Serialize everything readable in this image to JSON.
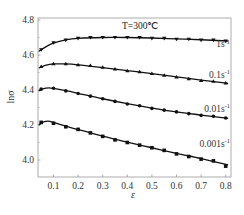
{
  "chart_data": {
    "type": "line",
    "title": "",
    "annotation": "T=300℃",
    "xlabel": "ε",
    "ylabel": "lnσ",
    "xlim": [
      0.04,
      0.81
    ],
    "ylim": [
      3.9,
      4.8
    ],
    "xticks": [
      0.1,
      0.2,
      0.3,
      0.4,
      0.5,
      0.6,
      0.7,
      0.8
    ],
    "xtick_labels": [
      "0.1",
      "0.2",
      "0.3",
      "0.4",
      "0.5",
      "0.6",
      "0.7",
      "0.8"
    ],
    "yticks": [
      4.0,
      4.2,
      4.4,
      4.6,
      4.8
    ],
    "ytick_labels": [
      "4.0",
      "4.2",
      "4.4",
      "4.6",
      "4.8"
    ],
    "grid": false,
    "legend": "inline labels at right end of each curve",
    "series": [
      {
        "name": "1s⁻¹",
        "label": "1s",
        "marker": "triangle-down",
        "x": [
          0.05,
          0.1,
          0.15,
          0.2,
          0.25,
          0.3,
          0.35,
          0.4,
          0.45,
          0.5,
          0.55,
          0.6,
          0.65,
          0.7,
          0.75,
          0.8
        ],
        "y": [
          4.63,
          4.67,
          4.685,
          4.695,
          4.7,
          4.7,
          4.7,
          4.7,
          4.7,
          4.695,
          4.695,
          4.69,
          4.69,
          4.685,
          4.685,
          4.68
        ]
      },
      {
        "name": "0.1s⁻¹",
        "label": "0.1s",
        "marker": "triangle-up",
        "x": [
          0.05,
          0.1,
          0.15,
          0.2,
          0.25,
          0.3,
          0.35,
          0.4,
          0.45,
          0.5,
          0.55,
          0.6,
          0.65,
          0.7,
          0.75,
          0.8
        ],
        "y": [
          4.535,
          4.55,
          4.55,
          4.545,
          4.54,
          4.53,
          4.52,
          4.51,
          4.505,
          4.495,
          4.485,
          4.475,
          4.465,
          4.455,
          4.45,
          4.44
        ]
      },
      {
        "name": "0.01s⁻¹",
        "label": "0.01s",
        "marker": "circle",
        "x": [
          0.05,
          0.1,
          0.15,
          0.2,
          0.25,
          0.3,
          0.35,
          0.4,
          0.45,
          0.5,
          0.55,
          0.6,
          0.65,
          0.7,
          0.75,
          0.8
        ],
        "y": [
          4.405,
          4.41,
          4.395,
          4.38,
          4.365,
          4.35,
          4.335,
          4.32,
          4.31,
          4.295,
          4.285,
          4.275,
          4.265,
          4.255,
          4.25,
          4.24
        ]
      },
      {
        "name": "0.001s⁻¹",
        "label": "0.001s",
        "marker": "square",
        "x": [
          0.05,
          0.1,
          0.15,
          0.2,
          0.25,
          0.3,
          0.35,
          0.4,
          0.45,
          0.5,
          0.55,
          0.6,
          0.65,
          0.7,
          0.75,
          0.8
        ],
        "y": [
          4.215,
          4.21,
          4.19,
          4.175,
          4.155,
          4.135,
          4.115,
          4.1,
          4.085,
          4.07,
          4.055,
          4.035,
          4.02,
          4.005,
          3.995,
          3.965
        ]
      }
    ],
    "fit_curves": [
      [
        [
          0.04,
          4.62
        ],
        [
          0.07,
          4.648
        ],
        [
          0.1,
          4.668
        ],
        [
          0.15,
          4.686
        ],
        [
          0.2,
          4.695
        ],
        [
          0.3,
          4.7
        ],
        [
          0.4,
          4.7
        ],
        [
          0.5,
          4.697
        ],
        [
          0.6,
          4.692
        ],
        [
          0.7,
          4.687
        ],
        [
          0.81,
          4.68
        ]
      ],
      [
        [
          0.04,
          4.525
        ],
        [
          0.07,
          4.542
        ],
        [
          0.1,
          4.549
        ],
        [
          0.15,
          4.549
        ],
        [
          0.2,
          4.544
        ],
        [
          0.3,
          4.528
        ],
        [
          0.4,
          4.511
        ],
        [
          0.5,
          4.494
        ],
        [
          0.6,
          4.475
        ],
        [
          0.7,
          4.457
        ],
        [
          0.81,
          4.438
        ]
      ],
      [
        [
          0.04,
          4.395
        ],
        [
          0.06,
          4.408
        ],
        [
          0.08,
          4.412
        ],
        [
          0.1,
          4.409
        ],
        [
          0.15,
          4.396
        ],
        [
          0.2,
          4.381
        ],
        [
          0.3,
          4.35
        ],
        [
          0.4,
          4.322
        ],
        [
          0.5,
          4.297
        ],
        [
          0.6,
          4.275
        ],
        [
          0.7,
          4.257
        ],
        [
          0.81,
          4.238
        ]
      ],
      [
        [
          0.04,
          4.2
        ],
        [
          0.06,
          4.218
        ],
        [
          0.08,
          4.222
        ],
        [
          0.1,
          4.215
        ],
        [
          0.15,
          4.194
        ],
        [
          0.2,
          4.174
        ],
        [
          0.3,
          4.136
        ],
        [
          0.4,
          4.102
        ],
        [
          0.5,
          4.07
        ],
        [
          0.6,
          4.038
        ],
        [
          0.7,
          4.008
        ],
        [
          0.81,
          3.972
        ]
      ]
    ],
    "label_positions": [
      {
        "x": 0.72,
        "y": 4.645
      },
      {
        "x": 0.72,
        "y": 4.47
      },
      {
        "x": 0.72,
        "y": 4.275
      },
      {
        "x": 0.67,
        "y": 4.075
      }
    ]
  },
  "labels": {
    "annotation": "T=300℃",
    "xlabel": "ε",
    "ylabel": "lnσ",
    "unit_exp": "-1"
  },
  "colors": {
    "axis": "#888888",
    "line": "#111111",
    "marker": "#111111",
    "text": "#333333"
  }
}
